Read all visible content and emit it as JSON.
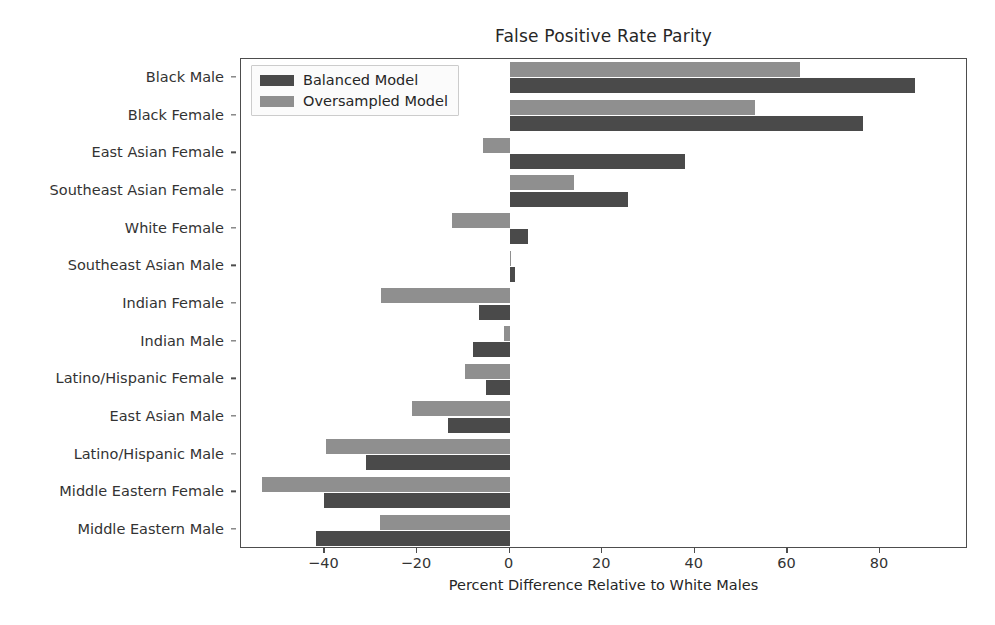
{
  "chart_data": {
    "type": "bar",
    "orientation": "horizontal",
    "title": "False Positive Rate Parity",
    "xlabel": "Percent Difference Relative to White Males",
    "ylabel": "",
    "xlim": [
      -58,
      99
    ],
    "xticks": [
      -40,
      -20,
      0,
      20,
      40,
      60,
      80
    ],
    "xticklabels": [
      "−40",
      "−20",
      "0",
      "20",
      "40",
      "60",
      "80"
    ],
    "grid": false,
    "legend_position": "upper left",
    "categories": [
      "Black Male",
      "Black Female",
      "East Asian Female",
      "Southeast Asian Female",
      "White Female",
      "Southeast Asian Male",
      "Indian Female",
      "Indian Male",
      "Latino/Hispanic Female",
      "East Asian Male",
      "Latino/Hispanic Male",
      "Middle Eastern Female",
      "Middle Eastern Male"
    ],
    "series": [
      {
        "name": "Balanced Model",
        "color": "#4a4a4a",
        "values": [
          87.6,
          76.3,
          37.8,
          25.5,
          3.9,
          1.1,
          -6.5,
          -8.0,
          -5.0,
          -13.4,
          -31.0,
          -40.0,
          -41.7
        ]
      },
      {
        "name": "Oversampled Model",
        "color": "#8f8f8f",
        "values": [
          62.7,
          53.0,
          -5.8,
          14.0,
          -12.5,
          0.4,
          -27.7,
          -1.2,
          -9.7,
          -21.0,
          -39.6,
          -53.4,
          -28.0
        ]
      }
    ]
  },
  "legend": {
    "items": [
      {
        "label": "Balanced Model",
        "swatch": "balanced"
      },
      {
        "label": "Oversampled Model",
        "swatch": "oversampled"
      }
    ]
  }
}
